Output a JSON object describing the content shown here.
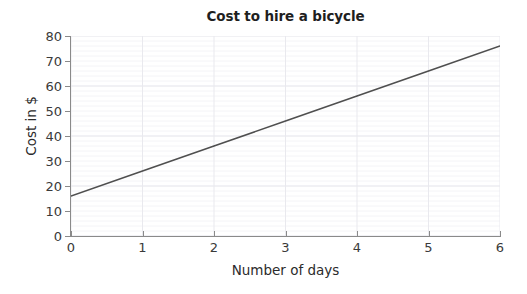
{
  "chart_data": {
    "type": "line",
    "title": "Cost to hire a bicycle",
    "xlabel": "Number of days",
    "ylabel": "Cost in $",
    "xlim": [
      0,
      6
    ],
    "ylim": [
      0,
      80
    ],
    "x_ticks": [
      "0",
      "1",
      "2",
      "3",
      "4",
      "5",
      "6"
    ],
    "y_ticks": [
      "0",
      "10",
      "20",
      "30",
      "40",
      "50",
      "60",
      "70",
      "80"
    ],
    "x_tick_values": [
      0,
      1,
      2,
      3,
      4,
      5,
      6
    ],
    "y_tick_values": [
      0,
      10,
      20,
      30,
      40,
      50,
      60,
      70,
      80
    ],
    "grid": "faint horizontal minor gridlines every 2 units and vertical gridlines at each integer day",
    "legend": "none",
    "series": [
      {
        "name": "Cost to hire a bicycle",
        "color": "#4f4f4f",
        "x": [
          0,
          1,
          2,
          3,
          4,
          5,
          6
        ],
        "values": [
          16,
          26,
          36,
          46,
          56,
          66,
          76
        ],
        "relationship": "cost = 16 + 10 x days"
      }
    ]
  },
  "colors": {
    "line": "#4f4f4f",
    "axis": "#8a8a8a",
    "grid_major": "#e9e9ee",
    "grid_minor": "#f4f4f7",
    "title_text": "#1f1f1f",
    "label_text": "#2b2b2b",
    "background": "#ffffff"
  }
}
